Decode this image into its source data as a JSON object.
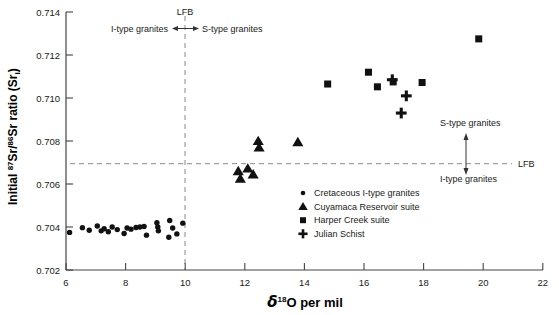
{
  "chart_data": {
    "type": "scatter",
    "title": "",
    "xlabel": "d18O per mil",
    "ylabel": "Initial 87Sr/86Sr ratio (Sri)",
    "xlim": [
      6,
      22
    ],
    "ylim": [
      0.702,
      0.714
    ],
    "xticks": [
      "6",
      "8",
      "10",
      "12",
      "14",
      "16",
      "18",
      "20",
      "22"
    ],
    "xtick_values": [
      6,
      8,
      10,
      12,
      14,
      16,
      18,
      20,
      22
    ],
    "yticks": [
      "0.702",
      "0.704",
      "0.706",
      "0.708",
      "0.710",
      "0.712",
      "0.714"
    ],
    "ytick_values": [
      0.702,
      0.704,
      0.706,
      0.708,
      0.71,
      0.712,
      0.714
    ],
    "grid": false,
    "legend_position": "inside-right-lower",
    "reference_lines": [
      {
        "name": "lfb-vertical",
        "orientation": "vertical",
        "value": 10,
        "style": "dashed",
        "label": "LFB"
      },
      {
        "name": "lfb-horizontal",
        "orientation": "horizontal",
        "value": 0.708,
        "style": "dashed",
        "label": "LFB"
      }
    ],
    "series": [
      {
        "name": "Cretaceous I-type granites",
        "marker": "circle",
        "color": "#111111",
        "points": [
          [
            6.12,
            0.70375
          ],
          [
            6.55,
            0.70397
          ],
          [
            6.78,
            0.70385
          ],
          [
            7.05,
            0.70405
          ],
          [
            7.18,
            0.70382
          ],
          [
            7.28,
            0.70392
          ],
          [
            7.42,
            0.70378
          ],
          [
            7.55,
            0.704
          ],
          [
            7.72,
            0.70388
          ],
          [
            7.95,
            0.7037
          ],
          [
            8.05,
            0.70395
          ],
          [
            8.18,
            0.7039
          ],
          [
            8.35,
            0.70398
          ],
          [
            8.48,
            0.704
          ],
          [
            8.62,
            0.70402
          ],
          [
            8.7,
            0.70362
          ],
          [
            9.05,
            0.7042
          ],
          [
            9.08,
            0.704
          ],
          [
            9.1,
            0.70382
          ],
          [
            9.48,
            0.7043
          ],
          [
            9.58,
            0.70395
          ],
          [
            9.72,
            0.70368
          ],
          [
            9.92,
            0.70418
          ],
          [
            9.45,
            0.70352
          ]
        ]
      },
      {
        "name": "Cuyamaca Reservoir suite",
        "marker": "triangle",
        "color": "#111111",
        "points": [
          [
            11.78,
            0.7066
          ],
          [
            11.85,
            0.70625
          ],
          [
            12.1,
            0.70672
          ],
          [
            12.28,
            0.70645
          ],
          [
            12.45,
            0.708
          ],
          [
            12.48,
            0.7077
          ],
          [
            13.78,
            0.70795
          ]
        ]
      },
      {
        "name": "Harper Creek suite",
        "marker": "square",
        "color": "#111111",
        "points": [
          [
            14.78,
            0.71065
          ],
          [
            16.15,
            0.7112
          ],
          [
            16.45,
            0.71052
          ],
          [
            16.98,
            0.71075
          ],
          [
            17.95,
            0.71072
          ],
          [
            19.85,
            0.71275
          ]
        ]
      },
      {
        "name": "Julian Schist",
        "marker": "plus",
        "color": "#111111",
        "points": [
          [
            16.95,
            0.71085
          ],
          [
            17.42,
            0.7101
          ],
          [
            17.25,
            0.7093
          ]
        ]
      }
    ]
  },
  "annotations": {
    "top_lfb_label": "LFB",
    "top_left_label": "I-type granites",
    "top_right_label": "S-type granites",
    "right_lfb_label": "LFB",
    "right_upper_label": "S-type granites",
    "right_lower_label": "I-type granites"
  },
  "axis": {
    "x_title_symbol": "δ",
    "x_title_sup": "18",
    "x_title_rest": "O per mil",
    "y_title_pre": "Initial ",
    "y_title_sup1": "87",
    "y_title_mid1": "Sr/",
    "y_title_sup2": "86",
    "y_title_mid2": "Sr ratio (Sr",
    "y_title_sub": "i",
    "y_title_end": ")"
  },
  "legend": {
    "items": [
      {
        "label": "Cretaceous I-type granites",
        "marker": "circle"
      },
      {
        "label": "Cuyamaca Reservoir suite",
        "marker": "triangle"
      },
      {
        "label": "Harper Creek suite",
        "marker": "square"
      },
      {
        "label": "Julian Schist",
        "marker": "plus"
      }
    ]
  }
}
